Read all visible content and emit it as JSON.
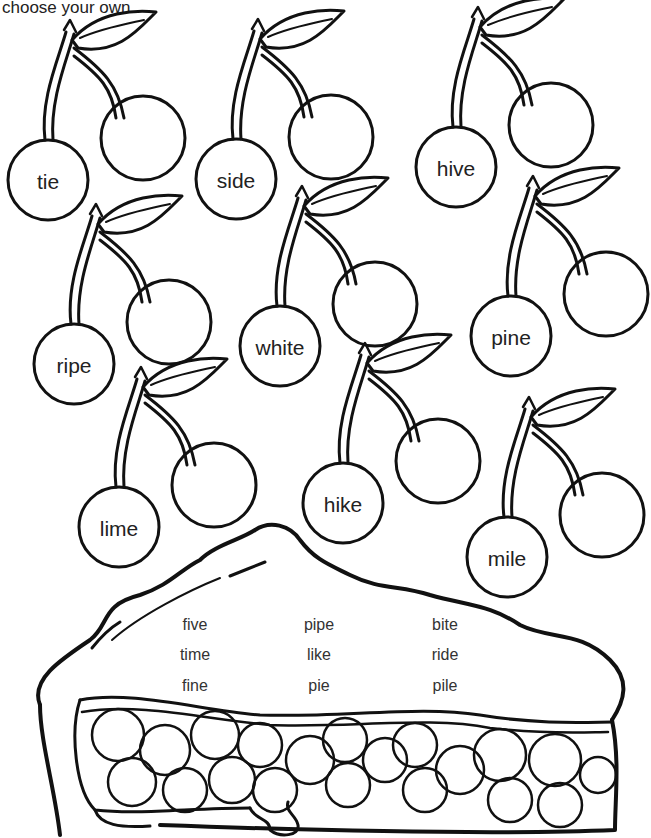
{
  "instruction": "choose your own.",
  "cherries": [
    {
      "word": "tie",
      "cx": 48,
      "cy": 180
    },
    {
      "word": "side",
      "cx": 236,
      "cy": 179
    },
    {
      "word": "hive",
      "cx": 456,
      "cy": 167
    },
    {
      "word": "ripe",
      "cx": 74,
      "cy": 364
    },
    {
      "word": "white",
      "cx": 280,
      "cy": 346
    },
    {
      "word": "pine",
      "cx": 511,
      "cy": 336
    },
    {
      "word": "lime",
      "cx": 119,
      "cy": 527
    },
    {
      "word": "hike",
      "cx": 343,
      "cy": 503
    },
    {
      "word": "mile",
      "cx": 507,
      "cy": 557
    }
  ],
  "pie": {
    "word_columns": [
      [
        "five",
        "time",
        "fine"
      ],
      [
        "pipe",
        "like",
        "pie"
      ],
      [
        "bite",
        "ride",
        "pile"
      ]
    ]
  },
  "colors": {
    "ink": "#111111",
    "background": "#ffffff"
  }
}
